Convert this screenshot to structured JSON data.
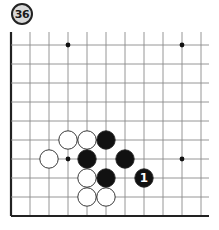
{
  "problem": {
    "number_label": "36"
  },
  "board": {
    "origin_x": 11,
    "origin_y": 45,
    "spacing": 19.0,
    "cols": 11,
    "rows": 10,
    "top_open_extent_y": 32,
    "right_open_extent_x": 209,
    "edges": [
      "left",
      "bottom"
    ],
    "line_color": "#8a8a8a",
    "edge_color": "#222222",
    "star_points": [
      {
        "col": 3,
        "row": 0
      },
      {
        "col": 9,
        "row": 0
      },
      {
        "col": 3,
        "row": 6
      },
      {
        "col": 9,
        "row": 6
      }
    ],
    "stones": [
      {
        "color": "white",
        "col": 3,
        "row": 5
      },
      {
        "color": "white",
        "col": 4,
        "row": 5
      },
      {
        "color": "black",
        "col": 5,
        "row": 5
      },
      {
        "color": "white",
        "col": 2,
        "row": 6
      },
      {
        "color": "black",
        "col": 4,
        "row": 6
      },
      {
        "color": "black",
        "col": 6,
        "row": 6
      },
      {
        "color": "white",
        "col": 4,
        "row": 7
      },
      {
        "color": "black",
        "col": 5,
        "row": 7
      },
      {
        "color": "black",
        "col": 7,
        "row": 7,
        "label": "1"
      },
      {
        "color": "white",
        "col": 4,
        "row": 8
      },
      {
        "color": "white",
        "col": 5,
        "row": 8
      }
    ]
  }
}
